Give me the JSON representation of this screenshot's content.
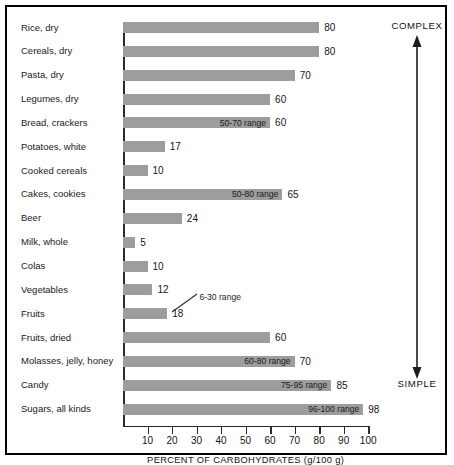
{
  "chart_data": {
    "type": "bar",
    "orientation": "horizontal",
    "title": "",
    "xlabel": "PERCENT OF CARBOHYDRATES (g/100 g)",
    "ylabel": "",
    "xlim": [
      0,
      100
    ],
    "xticks": [
      10,
      20,
      30,
      40,
      50,
      60,
      70,
      80,
      90,
      100
    ],
    "grid": false,
    "legend": false,
    "categories": [
      "Rice, dry",
      "Cereals, dry",
      "Pasta, dry",
      "Legumes, dry",
      "Bread, crackers",
      "Potatoes, white",
      "Cooked cereals",
      "Cakes, cookies",
      "Beer",
      "Milk, whole",
      "Colas",
      "Vegetables",
      "Fruits",
      "Fruits, dried",
      "Molasses, jelly, honey",
      "Candy",
      "Sugars, all kinds"
    ],
    "values": [
      80,
      80,
      70,
      60,
      60,
      17,
      10,
      65,
      24,
      5,
      10,
      12,
      18,
      60,
      70,
      85,
      98
    ],
    "value_labels": [
      "80",
      "80",
      "70",
      "60",
      "60",
      "17",
      "10",
      "65",
      "24",
      "5",
      "10",
      "12",
      "18",
      "60",
      "70",
      "85",
      "98"
    ],
    "range_labels": [
      {
        "category": "Bread, crackers",
        "text": "50-70 range",
        "placement": "on-bar"
      },
      {
        "category": "Cakes, cookies",
        "text": "50-80 range",
        "placement": "on-bar"
      },
      {
        "category": "Vegetables",
        "text": "6-30 range",
        "placement": "callout",
        "applies_to": [
          "Vegetables",
          "Fruits"
        ]
      },
      {
        "category": "Molasses, jelly, honey",
        "text": "60-80 range",
        "placement": "on-bar"
      },
      {
        "category": "Candy",
        "text": "75-95 range",
        "placement": "on-bar"
      },
      {
        "category": "Sugars, all kinds",
        "text": "96-100 range",
        "placement": "on-bar"
      }
    ],
    "annotations": [
      {
        "name": "complex-label",
        "text": "COMPLEX",
        "position": "top-right"
      },
      {
        "name": "simple-label",
        "text": "SIMPLE",
        "position": "bottom-right"
      },
      {
        "name": "gradient-arrow",
        "text": "",
        "description": "double-headed vertical arrow from COMPLEX to SIMPLE"
      }
    ],
    "colors": {
      "bar": "#9d9d9d",
      "axis": "#2b2b2b",
      "text": "#111111",
      "background": "#ffffff"
    }
  },
  "axis": {
    "title": "PERCENT OF CARBOHYDRATES (g/100 g)",
    "ticks": [
      "10",
      "20",
      "30",
      "40",
      "50",
      "60",
      "70",
      "80",
      "90",
      "100"
    ]
  },
  "side": {
    "complex": "COMPLEX",
    "simple": "SIMPLE"
  },
  "rows": [
    {
      "label": "Rice, dry",
      "value": 80,
      "value_label": "80",
      "range": ""
    },
    {
      "label": "Cereals, dry",
      "value": 80,
      "value_label": "80",
      "range": ""
    },
    {
      "label": "Pasta, dry",
      "value": 70,
      "value_label": "70",
      "range": ""
    },
    {
      "label": "Legumes, dry",
      "value": 60,
      "value_label": "60",
      "range": ""
    },
    {
      "label": "Bread, crackers",
      "value": 60,
      "value_label": "60",
      "range": "50-70 range"
    },
    {
      "label": "Potatoes, white",
      "value": 17,
      "value_label": "17",
      "range": ""
    },
    {
      "label": "Cooked cereals",
      "value": 10,
      "value_label": "10",
      "range": ""
    },
    {
      "label": "Cakes, cookies",
      "value": 65,
      "value_label": "65",
      "range": "50-80 range"
    },
    {
      "label": "Beer",
      "value": 24,
      "value_label": "24",
      "range": ""
    },
    {
      "label": "Milk, whole",
      "value": 5,
      "value_label": "5",
      "range": ""
    },
    {
      "label": "Colas",
      "value": 10,
      "value_label": "10",
      "range": ""
    },
    {
      "label": "Vegetables",
      "value": 12,
      "value_label": "12",
      "range": ""
    },
    {
      "label": "Fruits",
      "value": 18,
      "value_label": "18",
      "range": ""
    },
    {
      "label": "Fruits, dried",
      "value": 60,
      "value_label": "60",
      "range": ""
    },
    {
      "label": "Molasses, jelly, honey",
      "value": 70,
      "value_label": "70",
      "range": "60-80 range"
    },
    {
      "label": "Candy",
      "value": 85,
      "value_label": "85",
      "range": "75-95 range"
    },
    {
      "label": "Sugars, all kinds",
      "value": 98,
      "value_label": "98",
      "range": "96-100 range"
    }
  ],
  "callout": {
    "text": "6-30 range"
  }
}
